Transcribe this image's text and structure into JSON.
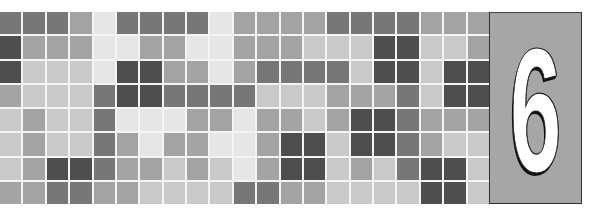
{
  "chapter": {
    "number": "6",
    "label": "Chapter number"
  },
  "colors": {
    "shade_1": "#e6e6e6",
    "shade_2": "#c9c9c9",
    "shade_3": "#a3a3a3",
    "shade_4": "#777777",
    "shade_5": "#4e4e4e",
    "panel": "#a6a6a6",
    "gridline": "#f4f4f4",
    "digit": "#ffffff"
  },
  "mosaic": {
    "rows": 8,
    "cols": 21,
    "shades": [
      [
        4,
        4,
        4,
        3,
        1,
        4,
        4,
        4,
        4,
        1,
        3,
        3,
        3,
        3,
        4,
        4,
        4,
        4,
        3,
        3,
        3
      ],
      [
        5,
        3,
        3,
        3,
        1,
        1,
        3,
        3,
        1,
        1,
        3,
        3,
        3,
        2,
        2,
        2,
        5,
        5,
        2,
        2,
        3
      ],
      [
        5,
        2,
        2,
        2,
        1,
        5,
        5,
        3,
        3,
        1,
        3,
        4,
        4,
        4,
        4,
        2,
        5,
        5,
        2,
        5,
        5
      ],
      [
        3,
        2,
        2,
        2,
        4,
        5,
        5,
        4,
        4,
        4,
        4,
        2,
        2,
        2,
        3,
        3,
        3,
        4,
        2,
        5,
        5
      ],
      [
        2,
        3,
        2,
        2,
        4,
        1,
        1,
        1,
        3,
        3,
        1,
        3,
        3,
        2,
        3,
        5,
        5,
        4,
        3,
        3,
        3
      ],
      [
        2,
        3,
        2,
        2,
        4,
        3,
        1,
        3,
        3,
        1,
        1,
        3,
        5,
        5,
        2,
        5,
        5,
        4,
        3,
        2,
        2
      ],
      [
        2,
        3,
        5,
        5,
        4,
        3,
        3,
        2,
        3,
        2,
        1,
        3,
        5,
        5,
        2,
        3,
        2,
        4,
        5,
        5,
        2
      ],
      [
        3,
        3,
        4,
        4,
        3,
        3,
        2,
        2,
        2,
        2,
        4,
        4,
        3,
        3,
        2,
        2,
        2,
        2,
        5,
        5,
        2
      ]
    ]
  }
}
